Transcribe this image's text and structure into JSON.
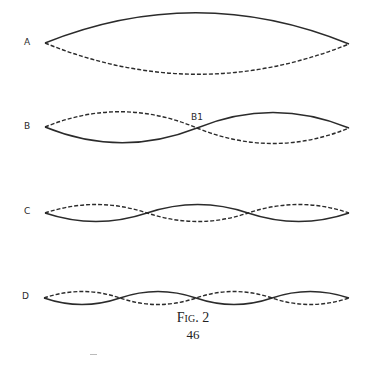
{
  "figure": {
    "title": "Fig. 2",
    "page_number": "46",
    "diagrams": [
      {
        "label": "A",
        "segments": 1
      },
      {
        "label": "B",
        "segments": 2,
        "node_label": "B1"
      },
      {
        "label": "C",
        "segments": 3
      },
      {
        "label": "D",
        "segments": 4
      }
    ]
  }
}
